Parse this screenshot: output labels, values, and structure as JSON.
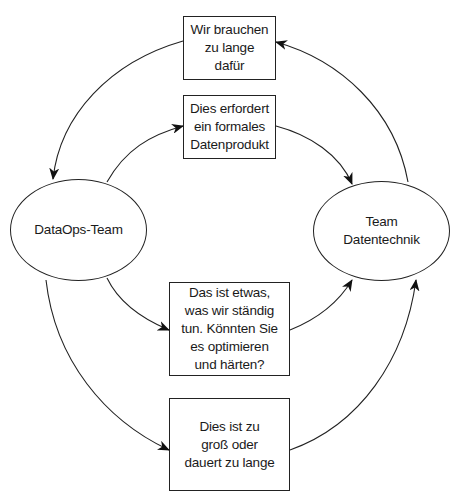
{
  "diagram": {
    "type": "cycle-flow",
    "colors": {
      "stroke": "#222222",
      "background": "#ffffff",
      "text": "#1a1a1a"
    },
    "nodes": {
      "dataops": {
        "shape": "ellipse",
        "label": "DataOps-Team"
      },
      "datatech": {
        "shape": "ellipse",
        "label": "Team\nDatentechnik"
      },
      "box_too_long": {
        "shape": "rectangle",
        "label": "Wir brauchen\nzu lange\ndafür"
      },
      "box_formal": {
        "shape": "rectangle",
        "label": "Dies erfordert\nein formales\nDatenprodukt"
      },
      "box_optimize": {
        "shape": "rectangle",
        "label": "Das ist etwas,\nwas wir ständig\ntun. Könnten Sie\nes optimieren\nund härten?"
      },
      "box_too_big": {
        "shape": "rectangle",
        "label": "Dies ist zu\ngroß oder\ndauert zu lange"
      }
    },
    "edges": [
      {
        "from": "datatech",
        "to": "box_too_long"
      },
      {
        "from": "box_too_long",
        "to": "dataops"
      },
      {
        "from": "dataops",
        "to": "box_formal"
      },
      {
        "from": "box_formal",
        "to": "datatech"
      },
      {
        "from": "dataops",
        "to": "box_optimize"
      },
      {
        "from": "box_optimize",
        "to": "datatech"
      },
      {
        "from": "dataops",
        "to": "box_too_big"
      },
      {
        "from": "box_too_big",
        "to": "datatech"
      }
    ]
  }
}
